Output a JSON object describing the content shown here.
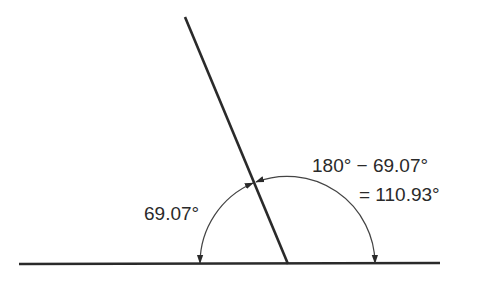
{
  "diagram": {
    "left_angle_label": "69.07°",
    "right_angle_label_line1": "180° − 69.07°",
    "right_angle_label_line2": "= 110.93°",
    "colors": {
      "line": "#2a2a2a",
      "arc": "#444444",
      "background": "#ffffff"
    }
  }
}
